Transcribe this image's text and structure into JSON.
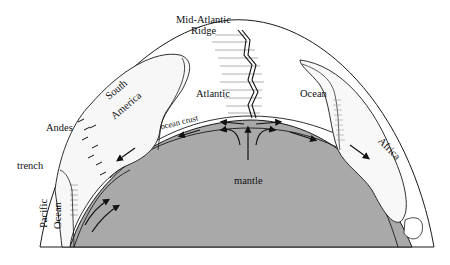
{
  "diagram": {
    "type": "cross-section",
    "labels": {
      "ridge_line1": "Mid-Atlantic",
      "ridge_line2": "Ridge",
      "atlantic": "Atlantic",
      "ocean": "Ocean",
      "south_line1": "South",
      "south_line2": "America",
      "andes": "Andes",
      "trench": "trench",
      "pacific": "Pacific",
      "pacific_ocean": "Ocean",
      "ocean_crust": "ocean crust",
      "africa": "Africa",
      "mantle": "mantle"
    },
    "colors": {
      "mantle_fill": "#a9a9a9",
      "continent_fill": "#ffffff",
      "line": "#1a1a1a",
      "background": "#ffffff"
    }
  }
}
